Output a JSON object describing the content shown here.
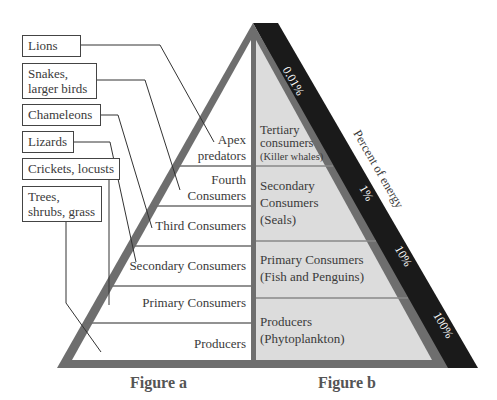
{
  "figure_a": {
    "caption": "Figure a",
    "organisms": [
      {
        "label_lines": [
          "Lions"
        ]
      },
      {
        "label_lines": [
          "Snakes,",
          "larger birds"
        ]
      },
      {
        "label_lines": [
          "Chameleons"
        ]
      },
      {
        "label_lines": [
          "Lizards"
        ]
      },
      {
        "label_lines": [
          "Crickets, locusts"
        ]
      },
      {
        "label_lines": [
          "Trees,",
          "shrubs, grass"
        ]
      }
    ],
    "levels": [
      {
        "lines": [
          "Apex",
          "predators"
        ]
      },
      {
        "lines": [
          "Fourth",
          "Consumers"
        ]
      },
      {
        "lines": [
          "Third Consumers"
        ]
      },
      {
        "lines": [
          "Secondary Consumers"
        ]
      },
      {
        "lines": [
          "Primary Consumers"
        ]
      },
      {
        "lines": [
          "Producers"
        ]
      }
    ]
  },
  "figure_b": {
    "caption": "Figure b",
    "levels": [
      {
        "lines": [
          "Tertiary",
          "consumers",
          "(Killer whales)"
        ]
      },
      {
        "lines": [
          "Secondary",
          "Consumers",
          "(Seals)"
        ]
      },
      {
        "lines": [
          "Primary Consumers",
          "(Fish and Penguins)"
        ]
      },
      {
        "lines": [
          "Producers",
          "(Phytoplankton)"
        ]
      }
    ],
    "energy_axis_label": "Percent of energy",
    "energy_values": [
      "0.01%",
      "1%",
      "10%",
      "100%"
    ]
  },
  "colors": {
    "outline_grey": "#707070",
    "energy_band": "#1a1a1a",
    "right_fill": "#dcdcdc",
    "left_fill": "#ffffff"
  }
}
